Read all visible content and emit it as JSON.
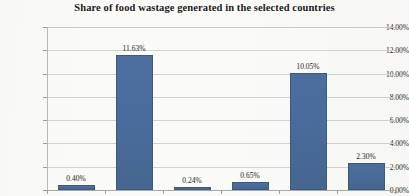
{
  "chart_data": {
    "type": "bar",
    "title": "Share of food wastage generated in the selected countries",
    "xlabel": "",
    "ylabel": "",
    "ylim": [
      0,
      14
    ],
    "ytick_labels": [
      "0.00%",
      "2.00%",
      "4.00%",
      "6.00%",
      "8.00%",
      "10.00%",
      "12.00%",
      "14.00%"
    ],
    "ytick_values": [
      0,
      2,
      4,
      6,
      8,
      10,
      12,
      14
    ],
    "grid": true,
    "legend": "none",
    "categories": [
      "",
      "",
      "",
      "",
      "",
      ""
    ],
    "values": [
      0.4,
      11.63,
      0.24,
      0.65,
      10.05,
      2.3
    ],
    "data_labels": [
      "0.40%",
      "11.63%",
      "0.24%",
      "0.65%",
      "10.05%",
      "2.30%"
    ],
    "series": [
      {
        "name": "Share of food wastage",
        "values": [
          0.4,
          11.63,
          0.24,
          0.65,
          10.05,
          2.3
        ]
      }
    ],
    "colors": {
      "bar_fill": "#4A6C9C",
      "bar_border": "#3C5A7F",
      "gridline": "#D2D2D2",
      "axis": "#A9A9A9",
      "text": "#1D1D1D",
      "background": "#FBFBF8"
    }
  }
}
